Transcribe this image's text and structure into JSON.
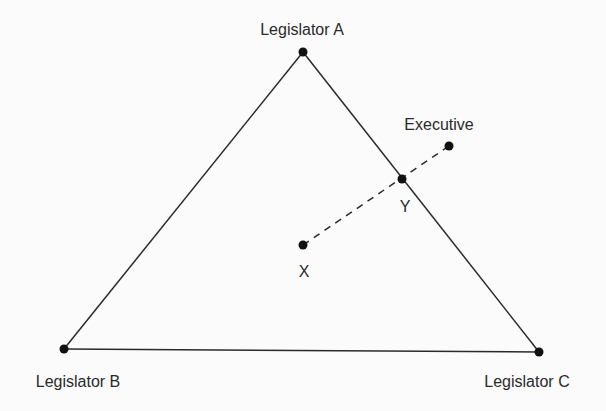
{
  "diagram": {
    "vertices": {
      "legislator_a": {
        "label": "Legislator A",
        "x": 303,
        "y": 52
      },
      "legislator_b": {
        "label": "Legislator B",
        "x": 64,
        "y": 349
      },
      "legislator_c": {
        "label": "Legislator C",
        "x": 539,
        "y": 352
      }
    },
    "points": {
      "executive": {
        "label": "Executive",
        "x": 449,
        "y": 146
      },
      "y": {
        "label": "Y",
        "x": 402,
        "y": 179
      },
      "x": {
        "label": "X",
        "x": 303,
        "y": 245
      }
    },
    "colors": {
      "line": "#2a2a2a",
      "dot": "#111111",
      "background": "#fbfbfb"
    }
  }
}
